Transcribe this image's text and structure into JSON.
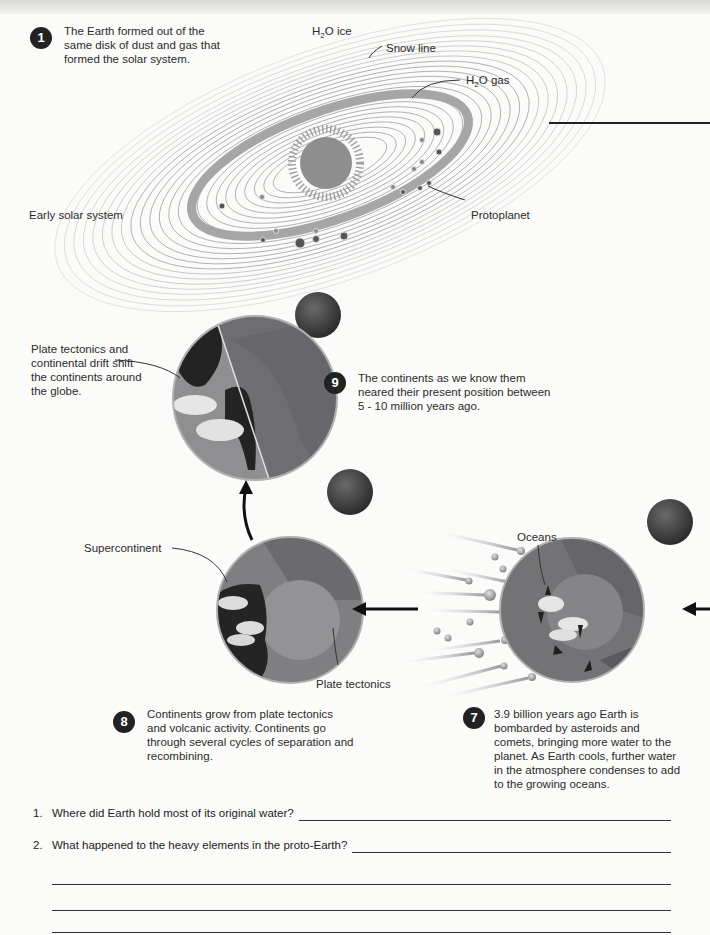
{
  "figure": {
    "type": "textbook diagram"
  },
  "step1": {
    "number": "1",
    "text_lines": [
      "The Earth formed out of the",
      "same disk of dust and gas that",
      "formed the solar system."
    ]
  },
  "solar_system": {
    "labels": {
      "h2o_ice_main": "H",
      "h2o_ice_sub": "2",
      "h2o_ice_rest": "O ice",
      "snow_line": "Snow line",
      "h2o_gas_main": "H",
      "h2o_gas_sub": "2",
      "h2o_gas_rest": "O gas",
      "early_solar_system": "Early solar system",
      "protoplanet": "Protoplanet"
    }
  },
  "step9": {
    "number": "9",
    "text_lines": [
      "The continents as we know them",
      "neared their present position between",
      "5 - 10 million years ago."
    ],
    "callout_lines": [
      "Plate tectonics and",
      "continental drift shift",
      "the continents around",
      "the globe."
    ]
  },
  "step8": {
    "number": "8",
    "text_lines": [
      "Continents grow from plate tectonics",
      "and volcanic activity. Continents go",
      "through several cycles of separation and",
      "recombining."
    ],
    "labels": {
      "supercontinent": "Supercontinent",
      "plate_tectonics": "Plate tectonics"
    }
  },
  "step7": {
    "number": "7",
    "text_lines": [
      "3.9 billion years ago Earth is",
      "bombarded by asteroids and",
      "comets, bringing more water to the",
      "planet. As Earth cools, further water",
      "in the atmosphere condenses to add",
      "to the growing oceans."
    ],
    "labels": {
      "oceans": "Oceans"
    }
  },
  "questions": [
    {
      "number": "1.",
      "text": "Where did Earth hold most of its original water?",
      "answer": ""
    },
    {
      "number": "2.",
      "text": "What happened to the heavy elements in the proto-Earth?",
      "answer": ""
    }
  ],
  "colors": {
    "badge": "#222222",
    "earth_blue": "#7d7d80",
    "land": "#2a2a2a",
    "disk_band": "#a8a8a8"
  }
}
